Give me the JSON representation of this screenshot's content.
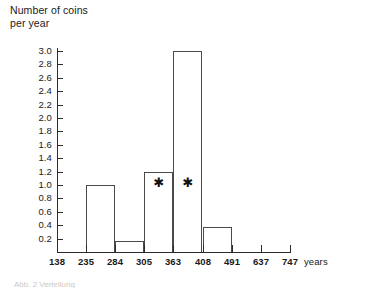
{
  "title": {
    "line1": "Number of coins",
    "line2": "per year",
    "full": "Number of coins\nper year"
  },
  "caption_scrap": "Abb. 2 Verteilung",
  "axes": {
    "y_labels": [
      "3.0",
      "2.8",
      "2.6",
      "2.4",
      "2.2",
      "2.0",
      "1.8",
      "1.6",
      "1.4",
      "1.2",
      "1.0",
      "0.8",
      "0.6",
      "0.4",
      "0.2"
    ],
    "y_values": [
      3.0,
      2.8,
      2.6,
      2.4,
      2.2,
      2.0,
      1.8,
      1.6,
      1.4,
      1.2,
      1.0,
      0.8,
      0.6,
      0.4,
      0.2
    ],
    "x_labels": [
      "138",
      "235",
      "284",
      "305",
      "363",
      "408",
      "491",
      "637",
      "747"
    ],
    "x_units_label": "years"
  },
  "annotations": {
    "star_glyph": "✱",
    "stars": [
      {
        "label": "star-bin-305-363",
        "bin_index": 3
      },
      {
        "label": "star-bin-363-408",
        "bin_index": 4
      }
    ]
  },
  "colors": {
    "axis": "#2b2b2b",
    "bar_outline": "#4a4a4a",
    "bar_fill": "transparent",
    "text": "#1a1a1a",
    "background": "#ffffff"
  },
  "chart_data": {
    "type": "bar",
    "title": "Number of coins per year",
    "xlabel": "years",
    "ylabel": "Number of coins per year",
    "ylim": [
      0,
      3.0
    ],
    "ytick_step": 0.2,
    "grid": false,
    "legend": null,
    "bin_edges": [
      138,
      235,
      284,
      305,
      363,
      408,
      491,
      637,
      747
    ],
    "categories": [
      "138-235",
      "235-284",
      "284-305",
      "305-363",
      "363-408",
      "408-491",
      "491-637",
      "637-747"
    ],
    "values": [
      0,
      1.0,
      0.17,
      1.2,
      3.0,
      0.37,
      0,
      0
    ],
    "annotations": [
      "* on 305-363 bar",
      "* on 363-408 bar"
    ]
  }
}
